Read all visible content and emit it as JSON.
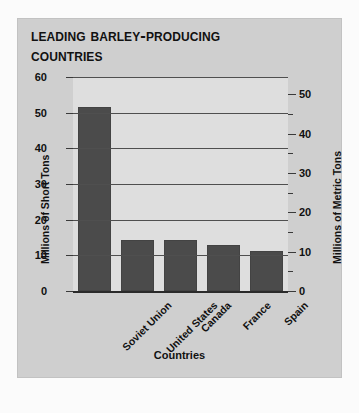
{
  "chart_data": {
    "type": "bar",
    "title": "Leading Barley-Producing Countries",
    "title_line1": "Leading Barley-Producing",
    "title_line2": "Countries",
    "xlabel": "Countries",
    "ylabel": "Millions of Short Tons",
    "ylabel_right": "Millions of Metric Tons",
    "categories": [
      "Soviet Union",
      "United States",
      "Canada",
      "France",
      "Spain"
    ],
    "values": [
      51.5,
      14.3,
      14.2,
      12.8,
      11.2
    ],
    "ylim": [
      0,
      60
    ],
    "yticks": [
      0,
      10,
      20,
      30,
      40,
      50,
      60
    ],
    "ytick_labels": [
      "0",
      "10",
      "20",
      "30",
      "40",
      "50",
      "60"
    ],
    "ylim_right": [
      0,
      54.4
    ],
    "yticks_right": [
      0,
      10,
      20,
      30,
      40,
      50
    ],
    "ytick_labels_right": [
      "0",
      "10",
      "20",
      "30",
      "40",
      "50"
    ],
    "yticks_right_minor": [
      5,
      15,
      25,
      35,
      45
    ],
    "grid": true,
    "legend": "none",
    "bar_color": "#4b4b4b",
    "plot_bg_color": "#dedede",
    "card_bg_color": "#cfcfcf",
    "axis_color": "#2a2a2a",
    "text_color": "#111111"
  }
}
